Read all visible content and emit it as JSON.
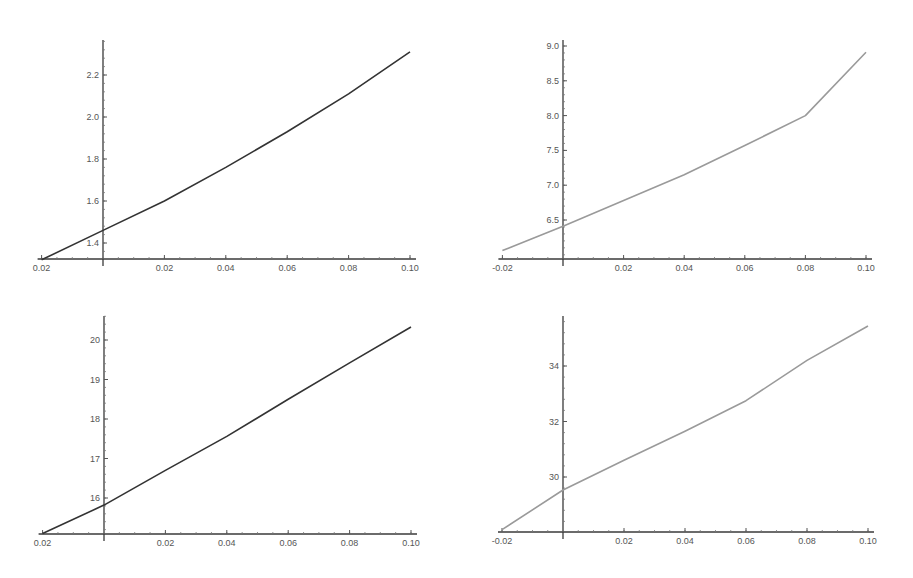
{
  "chart_data": [
    {
      "type": "line",
      "position": "top-left",
      "title": "",
      "xlabel": "",
      "ylabel": "",
      "xlim": [
        -0.02,
        0.1
      ],
      "ylim": [
        1.32,
        2.36
      ],
      "grid": false,
      "line_color": "#333333",
      "x_ticks": [
        -0.02,
        0.02,
        0.04,
        0.06,
        0.08,
        0.1
      ],
      "x_tick_labels": [
        "0.02",
        "0.02",
        "0.04",
        "0.06",
        "0.08",
        "0.10"
      ],
      "y_ticks": [
        1.4,
        1.6,
        1.8,
        2.0,
        2.2
      ],
      "y_tick_labels": [
        "1.4",
        "1.6",
        "1.8",
        "2.0",
        "2.2"
      ],
      "x": [
        -0.02,
        0.0,
        0.02,
        0.04,
        0.06,
        0.08,
        0.1
      ],
      "values": [
        1.32,
        1.46,
        1.6,
        1.76,
        1.93,
        2.11,
        2.31
      ]
    },
    {
      "type": "line",
      "position": "top-right",
      "title": "",
      "xlabel": "",
      "ylabel": "",
      "xlim": [
        -0.02,
        0.1
      ],
      "ylim": [
        6.06,
        9.0
      ],
      "grid": false,
      "line_color": "#9a9a9a",
      "x_ticks": [
        -0.02,
        0.02,
        0.04,
        0.06,
        0.08,
        0.1
      ],
      "x_tick_labels": [
        "-0.02",
        "0.02",
        "0.04",
        "0.06",
        "0.08",
        "0.10"
      ],
      "y_ticks": [
        6.5,
        7.0,
        7.5,
        8.0,
        8.5,
        9.0
      ],
      "y_tick_labels": [
        "6.5",
        "7.0",
        "7.5",
        "8.0",
        "8.5",
        "9.0"
      ],
      "x": [
        -0.02,
        0.0,
        0.02,
        0.04,
        0.06,
        0.08,
        0.1
      ],
      "values": [
        6.06,
        6.41,
        6.78,
        7.15,
        7.57,
        8.0,
        8.91
      ]
    },
    {
      "type": "line",
      "position": "bottom-left",
      "title": "",
      "xlabel": "",
      "ylabel": "",
      "xlim": [
        -0.02,
        0.1
      ],
      "ylim": [
        15.1,
        20.6
      ],
      "grid": false,
      "line_color": "#333333",
      "x_ticks": [
        -0.02,
        0.02,
        0.04,
        0.06,
        0.08,
        0.1
      ],
      "x_tick_labels": [
        "0.02",
        "0.02",
        "0.04",
        "0.06",
        "0.08",
        "0.10"
      ],
      "y_ticks": [
        16,
        17,
        18,
        19,
        20
      ],
      "y_tick_labels": [
        "16",
        "17",
        "18",
        "19",
        "20"
      ],
      "x": [
        -0.02,
        0.0,
        0.02,
        0.04,
        0.06,
        0.08,
        0.1
      ],
      "values": [
        15.1,
        15.82,
        16.7,
        17.56,
        18.5,
        19.42,
        20.33
      ]
    },
    {
      "type": "line",
      "position": "bottom-right",
      "title": "",
      "xlabel": "",
      "ylabel": "",
      "xlim": [
        -0.02,
        0.1
      ],
      "ylim": [
        28.1,
        35.7
      ],
      "grid": false,
      "line_color": "#9a9a9a",
      "x_ticks": [
        -0.02,
        0.02,
        0.04,
        0.06,
        0.08,
        0.1
      ],
      "x_tick_labels": [
        "-0.02",
        "0.02",
        "0.04",
        "0.06",
        "0.08",
        "0.10"
      ],
      "y_ticks": [
        30,
        32,
        34
      ],
      "y_tick_labels": [
        "30",
        "32",
        "34"
      ],
      "x": [
        -0.02,
        0.0,
        0.02,
        0.04,
        0.06,
        0.08,
        0.1
      ],
      "values": [
        28.1,
        29.53,
        30.6,
        31.65,
        32.75,
        34.2,
        35.44
      ]
    }
  ],
  "panels": [
    {
      "left": 0,
      "top": 0,
      "x_origin_px": 103,
      "x_scale": 3070,
      "y_axis_px": 259,
      "y_top_px": 40,
      "y_ref_val": 1.4,
      "y_ref_px": 243,
      "y_scale": 210
    },
    {
      "left": 0,
      "top": 0,
      "x_origin_px": 563,
      "x_scale": 3030,
      "y_axis_px": 259,
      "y_top_px": 40,
      "y_ref_val": 6.5,
      "y_ref_px": 220,
      "y_scale": 69.6
    },
    {
      "left": 0,
      "top": 0,
      "x_origin_px": 104,
      "x_scale": 3070,
      "y_axis_px": 534,
      "y_top_px": 316,
      "y_ref_val": 16,
      "y_ref_px": 498,
      "y_scale": 39.5
    },
    {
      "left": 0,
      "top": 0,
      "x_origin_px": 563,
      "x_scale": 3050,
      "y_axis_px": 532,
      "y_top_px": 316,
      "y_ref_val": 30,
      "y_ref_px": 477,
      "y_scale": 27.75
    }
  ]
}
